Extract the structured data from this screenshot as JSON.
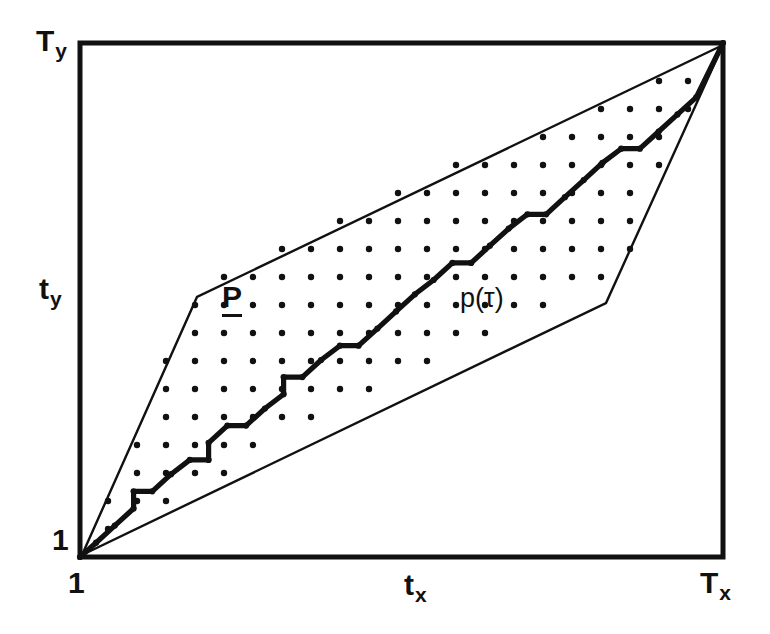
{
  "figure": {
    "background_color": "#ffffff",
    "ink_color": "#111111"
  },
  "axes": {
    "x": {
      "origin_label": "1",
      "mid_label_base": "t",
      "mid_label_sub": "x",
      "max_label_base": "T",
      "max_label_sub": "x"
    },
    "y": {
      "origin_label": "1",
      "mid_label_base": "t",
      "mid_label_sub": "y",
      "max_label_base": "T",
      "max_label_sub": "y"
    }
  },
  "annotations": {
    "region_label": "P",
    "path_label": "p(τ)"
  },
  "chart_data": {
    "type": "line",
    "xlabel": "t_x",
    "ylabel": "t_y",
    "xlim": [
      1,
      25
    ],
    "ylim": [
      1,
      19
    ],
    "grid": false,
    "legend": "none",
    "plot_frame_px": {
      "left": 80,
      "top": 43,
      "right": 723,
      "bottom": 557
    },
    "axis_tick_labels": {
      "x": [
        "1",
        "t_x",
        "T_x"
      ],
      "y": [
        "1",
        "t_y",
        "T_y"
      ]
    },
    "series": [
      {
        "name": "p(τ)",
        "role": "warping-path",
        "style": "thick-staircase",
        "stroke_width": 5,
        "x": [
          1,
          1.6,
          2.3,
          3.0,
          3.0,
          3.7,
          4.4,
          5.1,
          5.8,
          5.8,
          6.5,
          7.2,
          7.9,
          8.6,
          8.6,
          9.3,
          10.0,
          10.7,
          11.4,
          12.1,
          12.8,
          13.5,
          14.2,
          14.9,
          15.6,
          16.3,
          17.0,
          17.7,
          18.4,
          19.1,
          19.8,
          20.5,
          21.2,
          21.9,
          22.6,
          23.3,
          24.0,
          25
        ],
        "y": [
          1,
          1.5,
          2.1,
          2.7,
          3.3,
          3.3,
          3.9,
          4.4,
          4.4,
          5.0,
          5.6,
          5.6,
          6.2,
          6.7,
          7.3,
          7.3,
          7.9,
          8.4,
          8.4,
          9.0,
          9.6,
          10.2,
          10.7,
          11.3,
          11.3,
          11.9,
          12.5,
          13.0,
          13.0,
          13.6,
          14.2,
          14.8,
          15.3,
          15.3,
          15.9,
          16.5,
          17.1,
          19
        ]
      },
      {
        "name": "upper boundary",
        "role": "region-upper",
        "style": "thin-polyline",
        "stroke_width": 2,
        "x": [
          1,
          5.6,
          25
        ],
        "y": [
          1,
          11.3,
          19
        ]
      },
      {
        "name": "lower boundary",
        "role": "region-lower",
        "style": "thin-polyline",
        "stroke_width": 2,
        "x": [
          1,
          21.3,
          25
        ],
        "y": [
          1,
          10.8,
          19
        ]
      }
    ],
    "lattice_dots": {
      "description": "grid of candidate alignment points inside the admissible parallelogram",
      "spacing_x_px": 29,
      "spacing_y_px": 28,
      "radius_px": 3.2,
      "color": "#111111"
    }
  }
}
